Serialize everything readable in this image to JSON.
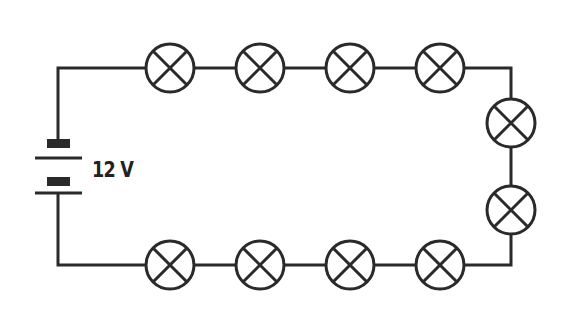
{
  "diagram": {
    "type": "series circuit",
    "stroke_color": "#2a2a2a",
    "battery": {
      "label": "12 V",
      "symbol": "battery-icon"
    },
    "bulbs": {
      "count": 10,
      "symbol": "lamp-icon",
      "top_row": 4,
      "right_side": 2,
      "bottom_row": 4
    }
  }
}
